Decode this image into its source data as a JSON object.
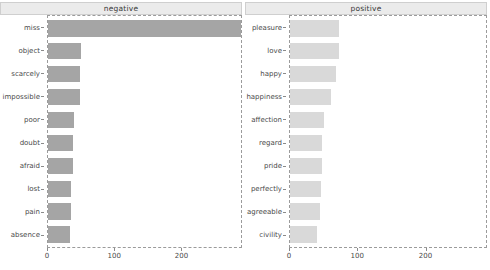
{
  "chart_data": [
    {
      "type": "bar",
      "orientation": "horizontal",
      "title": "negative",
      "xlabel": "",
      "ylabel": "",
      "xlim": [
        0,
        290
      ],
      "xticks": [
        0,
        100,
        200
      ],
      "xticklabels": [
        "0",
        "100",
        "200"
      ],
      "grid": false,
      "legend": "none",
      "bar_color": "#a5a5a5",
      "categories": [
        "miss",
        "object",
        "scarcely",
        "impossible",
        "poor",
        "doubt",
        "afraid",
        "lost",
        "pain",
        "absence"
      ],
      "values": [
        290,
        49,
        48,
        48,
        39,
        38,
        37,
        35,
        34,
        33
      ]
    },
    {
      "type": "bar",
      "orientation": "horizontal",
      "title": "positive",
      "xlabel": "",
      "ylabel": "",
      "xlim": [
        0,
        290
      ],
      "xticks": [
        0,
        100,
        200
      ],
      "xticklabels": [
        "0",
        "100",
        "200"
      ],
      "grid": false,
      "legend": "none",
      "bar_color": "#d9d9d9",
      "categories": [
        "pleasure",
        "love",
        "happy",
        "happiness",
        "affection",
        "regard",
        "pride",
        "perfectly",
        "agreeable",
        "civility"
      ],
      "values": [
        73,
        73,
        68,
        61,
        50,
        48,
        47,
        46,
        44,
        40
      ]
    }
  ]
}
